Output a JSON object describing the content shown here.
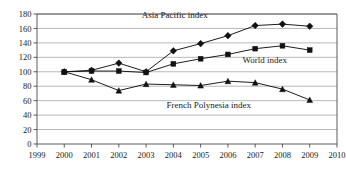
{
  "chart_data": {
    "type": "line",
    "title": "",
    "xlabel": "",
    "ylabel": "",
    "xlim": [
      1999,
      2010
    ],
    "ylim": [
      0,
      180
    ],
    "grid": true,
    "legend_position": "inline-annotations",
    "x": [
      2000,
      2001,
      2002,
      2003,
      2004,
      2005,
      2006,
      2007,
      2008,
      2009
    ],
    "xticks": [
      "1999",
      "2000",
      "2001",
      "2002",
      "2003",
      "2004",
      "2005",
      "2006",
      "2007",
      "2008",
      "2009",
      "2010"
    ],
    "yticks": [
      "0",
      "20",
      "40",
      "60",
      "80",
      "100",
      "120",
      "140",
      "160",
      "180"
    ],
    "series": [
      {
        "name": "Asia Pacific index",
        "marker": "diamond",
        "color": "#111111",
        "values": [
          100,
          102,
          112,
          100,
          129,
          139,
          150,
          164,
          166,
          163
        ]
      },
      {
        "name": "World index",
        "marker": "square",
        "color": "#111111",
        "values": [
          100,
          101,
          101,
          99,
          111,
          118,
          124,
          132,
          136,
          130
        ]
      },
      {
        "name": "French Polynesia index",
        "marker": "triangle",
        "color": "#111111",
        "values": [
          100,
          89,
          74,
          83,
          82,
          81,
          87,
          85,
          76,
          61
        ]
      }
    ],
    "annotations": [
      {
        "text": "Asia Pacific index",
        "x": 2004.05,
        "y": 174
      },
      {
        "text": "World index",
        "x": 2007.35,
        "y": 112
      },
      {
        "text": "French Polynesia index",
        "x": 2005.3,
        "y": 50
      }
    ]
  }
}
